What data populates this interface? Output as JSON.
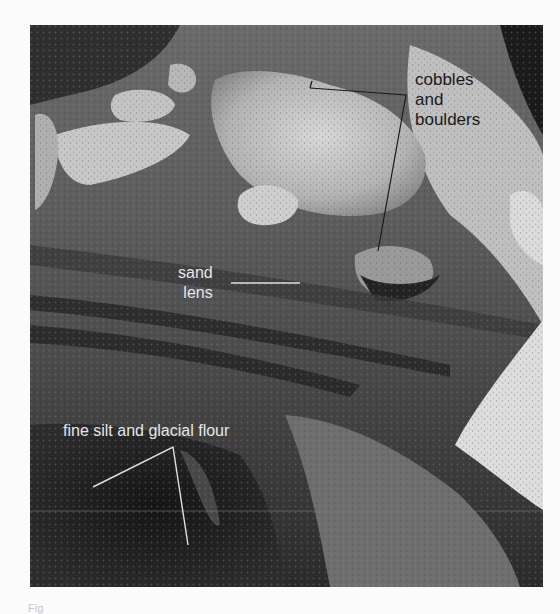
{
  "figure": {
    "photo_subject": "glacial till exposure",
    "labels": {
      "cobbles": [
        "cobbles",
        "and",
        "boulders"
      ],
      "sand_lens": [
        "sand",
        "lens"
      ],
      "fine_silt": "fine silt and glacial flour"
    },
    "caption": "Fig"
  },
  "colors": {
    "background": "#fbfbfb",
    "dark_label": "#1a1a1a",
    "light_label": "#e6e6e6"
  }
}
